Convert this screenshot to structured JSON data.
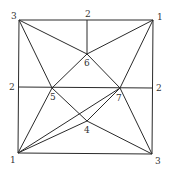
{
  "diagram": {
    "type": "crease-pattern-graph",
    "line_color": "#2a2a2a",
    "label_color": "#333333",
    "vertices": [
      {
        "id": "TL",
        "label": "3",
        "x": 19,
        "y": 20,
        "lx": 11,
        "ly": 19
      },
      {
        "id": "TM",
        "label": "2",
        "x": 87,
        "y": 20,
        "lx": 85,
        "ly": 17
      },
      {
        "id": "TR",
        "label": "1",
        "x": 153,
        "y": 20,
        "lx": 157,
        "ly": 20
      },
      {
        "id": "ML",
        "label": "2",
        "x": 18,
        "y": 87,
        "lx": 9,
        "ly": 90
      },
      {
        "id": "MR",
        "label": "2",
        "x": 153,
        "y": 88,
        "lx": 156,
        "ly": 91
      },
      {
        "id": "BL",
        "label": "1",
        "x": 18,
        "y": 153,
        "lx": 10,
        "ly": 163
      },
      {
        "id": "BR",
        "label": "3",
        "x": 152,
        "y": 154,
        "lx": 155,
        "ly": 164
      },
      {
        "id": "P4",
        "label": "4",
        "x": 87,
        "y": 121,
        "lx": 84,
        "ly": 133
      },
      {
        "id": "P5",
        "label": "5",
        "x": 52,
        "y": 88,
        "lx": 50,
        "ly": 100
      },
      {
        "id": "P6",
        "label": "6",
        "x": 87,
        "y": 54,
        "lx": 84,
        "ly": 66
      },
      {
        "id": "P7",
        "label": "7",
        "x": 120,
        "y": 88,
        "lx": 116,
        "ly": 101
      }
    ],
    "edges": [
      [
        "TL",
        "TR"
      ],
      [
        "TR",
        "BR"
      ],
      [
        "BR",
        "BL"
      ],
      [
        "BL",
        "TL"
      ],
      [
        "TM",
        "P6"
      ],
      [
        "ML",
        "MR"
      ],
      [
        "TL",
        "P6"
      ],
      [
        "TR",
        "P6"
      ],
      [
        "TL",
        "P5"
      ],
      [
        "P5",
        "P4"
      ],
      [
        "P4",
        "BR"
      ],
      [
        "TR",
        "P7"
      ],
      [
        "P7",
        "BL"
      ],
      [
        "BL",
        "P5"
      ],
      [
        "BL",
        "P4"
      ],
      [
        "BR",
        "P7"
      ],
      [
        "P7",
        "P6"
      ],
      [
        "P6",
        "P5"
      ],
      [
        "P4",
        "P7"
      ]
    ]
  }
}
